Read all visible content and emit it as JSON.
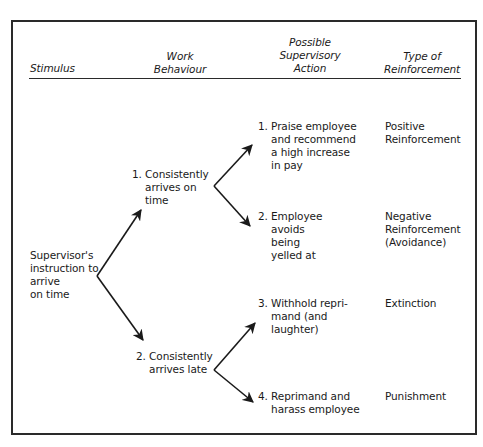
{
  "headers": {
    "stimulus": "Stimulus",
    "work_behaviour": "Work\nBehaviour",
    "supervisory_action": "Possible\nSupervisory\nAction",
    "reinforcement": "Type of\nReinforcement"
  },
  "stimulus": {
    "text": "Supervisor's\ninstruction to\narrive\non time"
  },
  "behaviours": [
    {
      "number": "1.",
      "text": "Consistently\narrives on\ntime"
    },
    {
      "number": "2.",
      "text": "Consistently\narrives late"
    }
  ],
  "actions": [
    {
      "number": "1.",
      "text": "Praise employee\nand recommend\na high increase\nin pay"
    },
    {
      "number": "2.",
      "text": "Employee\navoids\nbeing\nyelled at"
    },
    {
      "number": "3.",
      "text": "Withhold repri-\nmand (and\nlaughter)"
    },
    {
      "number": "4.",
      "text": "Reprimand and\nharass employee"
    }
  ],
  "reinforcements": [
    "Positive\nReinforcement",
    "Negative\nReinforcement\n(Avoidance)",
    "Extinction",
    "Punishment"
  ],
  "colors": {
    "ink": "#1a1a1a",
    "background": "#ffffff"
  }
}
